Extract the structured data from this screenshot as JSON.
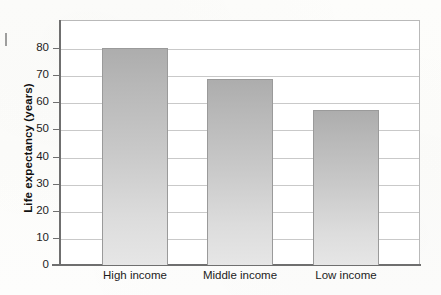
{
  "chart_data": {
    "type": "bar",
    "title": "",
    "xlabel": "",
    "ylabel": "Life expectancy (years)",
    "categories": [
      "High income",
      "Middle income",
      "Low income"
    ],
    "values": [
      80,
      68.5,
      57
    ],
    "ylim": [
      0,
      88
    ],
    "y_ticks": [
      0,
      10,
      20,
      30,
      40,
      50,
      60,
      70,
      80
    ],
    "y_tick_labels": [
      "0",
      "10",
      "20",
      "30",
      "40",
      "50",
      "60",
      "70",
      "80"
    ],
    "grid": true,
    "legend": "none",
    "bar_color_top": "#adadad",
    "bar_color_bottom": "#e6e6e6",
    "axis_color": "#6f6f6f",
    "gridline_color": "#c9c9c9"
  },
  "axes": {
    "y_title": "Life expectancy (years)"
  },
  "ticks": {
    "y": [
      {
        "value": 80,
        "label": "80"
      },
      {
        "value": 70,
        "label": "70"
      },
      {
        "value": 60,
        "label": "60"
      },
      {
        "value": 50,
        "label": "50"
      },
      {
        "value": 40,
        "label": "40"
      },
      {
        "value": 30,
        "label": "30"
      },
      {
        "value": 20,
        "label": "20"
      },
      {
        "value": 10,
        "label": "10"
      },
      {
        "value": 0,
        "label": "0"
      }
    ]
  },
  "bars": [
    {
      "label": "High income",
      "value": 80
    },
    {
      "label": "Middle income",
      "value": 68.5
    },
    {
      "label": "Low income",
      "value": 57
    }
  ]
}
